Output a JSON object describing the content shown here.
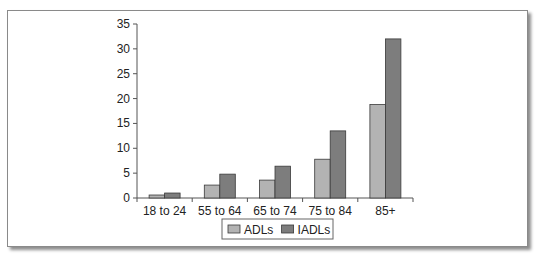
{
  "chart_data": {
    "type": "bar",
    "title": "",
    "xlabel": "",
    "ylabel": "",
    "categories": [
      "18 to 24",
      "55 to 64",
      "65 to 74",
      "75 to 84",
      "85+"
    ],
    "series": [
      {
        "name": "ADLs",
        "color": "#b3b3b3",
        "values": [
          0.6,
          2.6,
          3.6,
          7.8,
          18.8
        ]
      },
      {
        "name": "IADLs",
        "color": "#7d7d7d",
        "values": [
          1.0,
          4.8,
          6.4,
          13.5,
          32.0
        ]
      }
    ],
    "ylim": [
      0,
      35
    ],
    "yticks": [
      0,
      5,
      10,
      15,
      20,
      25,
      30,
      35
    ],
    "grid": false,
    "legend_position": "bottom-center"
  }
}
